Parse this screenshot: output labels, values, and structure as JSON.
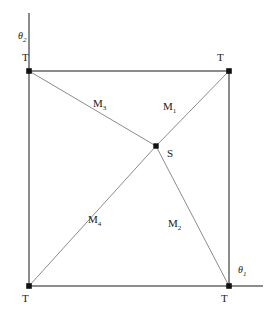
{
  "figure": {
    "type": "geometric-diagram",
    "background_color": "#ffffff",
    "line_color": "#8c8c8c",
    "node_color": "#111111",
    "text_color": "#1a1a1a",
    "canvas": {
      "width": 272,
      "height": 315
    },
    "square": {
      "left": 29,
      "top": 71,
      "right": 229,
      "bottom": 286
    },
    "axes": [
      {
        "name": "theta-2-axis",
        "label": "θ",
        "subscript": "2",
        "orientation": "vertical",
        "label_x": 18,
        "label_y": 31,
        "line": {
          "x1": 29,
          "y1": 13,
          "x2": 29,
          "y2": 286
        }
      },
      {
        "name": "theta-1-axis",
        "label": "θ",
        "subscript": "1",
        "orientation": "horizontal",
        "label_x": 238,
        "label_y": 265,
        "line": {
          "x1": 29,
          "y1": 286,
          "x2": 263,
          "y2": 286
        }
      }
    ],
    "center_node": {
      "id": "S",
      "label": "S",
      "x": 156,
      "y": 146,
      "label_x": 167,
      "label_y": 148
    },
    "corner_nodes": [
      {
        "id": "T-top-left",
        "label": "T",
        "x": 29,
        "y": 71,
        "label_x": 22,
        "label_y": 52
      },
      {
        "id": "T-top-right",
        "label": "T",
        "x": 229,
        "y": 71,
        "label_x": 217,
        "label_y": 52
      },
      {
        "id": "T-bottom-left",
        "label": "T",
        "x": 29,
        "y": 286,
        "label_x": 22,
        "label_y": 293
      },
      {
        "id": "T-bottom-right",
        "label": "T",
        "x": 229,
        "y": 286,
        "label_x": 221,
        "label_y": 293
      }
    ],
    "segments": [
      {
        "id": "M1",
        "label": "M",
        "subscript": "1",
        "from": "S",
        "to": "T-top-right",
        "x1": 156,
        "y1": 146,
        "x2": 229,
        "y2": 71,
        "label_x": 163,
        "label_y": 101
      },
      {
        "id": "M2",
        "label": "M",
        "subscript": "2",
        "from": "S",
        "to": "T-bottom-right",
        "x1": 156,
        "y1": 146,
        "x2": 229,
        "y2": 286,
        "label_x": 168,
        "label_y": 218
      },
      {
        "id": "M3",
        "label": "M",
        "subscript": "3",
        "from": "S",
        "to": "T-top-left",
        "x1": 156,
        "y1": 146,
        "x2": 29,
        "y2": 71,
        "label_x": 93,
        "label_y": 98
      },
      {
        "id": "M4",
        "label": "M",
        "subscript": "4",
        "from": "S",
        "to": "T-bottom-left",
        "x1": 156,
        "y1": 146,
        "x2": 29,
        "y2": 286,
        "label_x": 88,
        "label_y": 214
      }
    ],
    "square_edges": [
      {
        "id": "edge-top",
        "x1": 29,
        "y1": 71,
        "x2": 229,
        "y2": 71
      },
      {
        "id": "edge-right",
        "x1": 229,
        "y1": 71,
        "x2": 229,
        "y2": 286
      },
      {
        "id": "edge-bottom",
        "x1": 29,
        "y1": 286,
        "x2": 229,
        "y2": 286
      },
      {
        "id": "edge-left",
        "x1": 29,
        "y1": 71,
        "x2": 29,
        "y2": 286
      }
    ]
  }
}
